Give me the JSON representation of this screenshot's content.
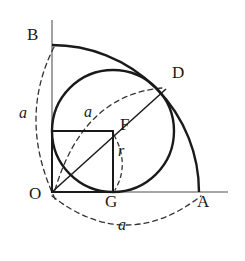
{
  "figure": {
    "width": 245,
    "height": 261,
    "background": "#ffffff",
    "stroke_color": "#1a1a1a",
    "axis_color": "#8a8a8a",
    "dash_color": "#333333"
  },
  "points": {
    "O": {
      "label": "O",
      "x": 52,
      "y": 192,
      "label_x": 29,
      "label_y": 193
    },
    "A": {
      "label": "A",
      "x": 200,
      "y": 192,
      "label_x": 197,
      "label_y": 199
    },
    "B": {
      "label": "B",
      "x": 52,
      "y": 45,
      "label_x": 28,
      "label_y": 32
    },
    "D": {
      "label": "D",
      "x": 165,
      "y": 90,
      "label_x": 170,
      "label_y": 70
    },
    "F": {
      "label": "F",
      "x": 113,
      "y": 131,
      "label_x": 120,
      "label_y": 123
    },
    "G": {
      "label": "G",
      "x": 113,
      "y": 192,
      "label_x": 107,
      "label_y": 199
    }
  },
  "measures": {
    "radius_big": {
      "label": "a",
      "value": 147
    },
    "radius_small": {
      "label": "r",
      "value": 61
    }
  },
  "annotations": [
    {
      "name": "arc-length-left",
      "label": "a",
      "x": 22,
      "y": 113
    },
    {
      "name": "arc-length-inner",
      "label": "a",
      "x": 86,
      "y": 112
    },
    {
      "name": "radius-small-label",
      "label": "r",
      "x": 119,
      "y": 150
    },
    {
      "name": "arc-length-bottom",
      "label": "a",
      "x": 120,
      "y": 224
    }
  ],
  "shapes": {
    "quarter_arc": {
      "name": "arc-B-to-A",
      "center": [
        52,
        192
      ],
      "radius": 147,
      "from": [
        52,
        45
      ],
      "to": [
        200,
        192
      ]
    },
    "inner_circle": {
      "name": "inscribed-circle",
      "center": [
        113,
        131
      ],
      "radius": 61
    },
    "square": {
      "name": "square-O-G-F",
      "x": 52,
      "y": 131,
      "width": 61,
      "height": 61
    },
    "diagonal": {
      "name": "line-O-to-D",
      "from": [
        52,
        192
      ],
      "to": [
        165,
        90
      ]
    },
    "x_axis": {
      "name": "x-axis",
      "from": [
        52,
        192
      ],
      "to": [
        228,
        192
      ]
    },
    "y_axis": {
      "name": "y-axis",
      "from": [
        52,
        20
      ],
      "to": [
        52,
        192
      ]
    }
  },
  "dashed_arcs": {
    "left": {
      "name": "dashed-arc-B-O",
      "d": "M 54 47 Q 18 120 56 200"
    },
    "inner": {
      "name": "dashed-arc-O-D",
      "d": "M 55 190 Q 84 94 163 88"
    },
    "radius": {
      "name": "dashed-arc-F-G",
      "d": "M 114 134 Q 129 164 116 191"
    },
    "bottom": {
      "name": "dashed-arc-O-A",
      "d": "M 52 196 Q 126 252 200 196"
    }
  }
}
